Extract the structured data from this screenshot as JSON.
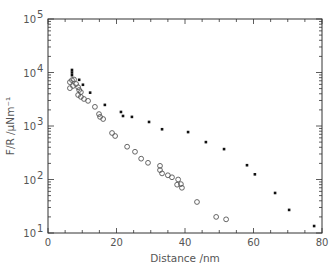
{
  "chart_data": {
    "type": "scatter",
    "title": "",
    "xlabel": "Distance  /nm",
    "ylabel": "F/R  /μNm⁻¹",
    "xlim": [
      0,
      80
    ],
    "ylim": [
      10,
      100000
    ],
    "yscale": "log",
    "xticks": [
      0,
      20,
      40,
      60,
      80
    ],
    "yticks": [
      10,
      100,
      1000,
      10000,
      100000
    ],
    "ytick_labels": [
      {
        "base": "10",
        "exp": "1"
      },
      {
        "base": "10",
        "exp": "2"
      },
      {
        "base": "10",
        "exp": "3"
      },
      {
        "base": "10",
        "exp": "4"
      },
      {
        "base": "10",
        "exp": "5"
      }
    ],
    "grid": false,
    "legend": null,
    "series": [
      {
        "name": "filled",
        "marker": "filled-dot",
        "color": "#111111",
        "points": [
          [
            7.0,
            11150
          ],
          [
            7.0,
            10000
          ],
          [
            7.0,
            8900
          ],
          [
            9.1,
            7300
          ],
          [
            10.2,
            5900
          ],
          [
            12.3,
            4200
          ],
          [
            16.6,
            2480
          ],
          [
            21.3,
            1830
          ],
          [
            21.9,
            1540
          ],
          [
            24.5,
            1480
          ],
          [
            29.5,
            1190
          ],
          [
            33.3,
            870
          ],
          [
            40.9,
            770
          ],
          [
            46.1,
            500
          ],
          [
            51.4,
            370
          ],
          [
            58.1,
            185
          ],
          [
            60.4,
            125
          ],
          [
            66.3,
            56
          ],
          [
            70.4,
            27
          ],
          [
            77.7,
            13.5
          ]
        ]
      },
      {
        "name": "open",
        "marker": "open-circle",
        "color": "#555555",
        "points": [
          [
            6.4,
            6600
          ],
          [
            7.0,
            7200
          ],
          [
            7.6,
            7400
          ],
          [
            6.4,
            5100
          ],
          [
            7.3,
            5600
          ],
          [
            8.2,
            6100
          ],
          [
            8.8,
            5300
          ],
          [
            9.1,
            4700
          ],
          [
            9.6,
            4300
          ],
          [
            8.8,
            3800
          ],
          [
            9.6,
            3500
          ],
          [
            10.5,
            3200
          ],
          [
            11.7,
            2950
          ],
          [
            13.7,
            2280
          ],
          [
            14.9,
            1670
          ],
          [
            15.2,
            1480
          ],
          [
            16.1,
            1350
          ],
          [
            18.7,
            740
          ],
          [
            19.6,
            650
          ],
          [
            23.1,
            410
          ],
          [
            25.4,
            330
          ],
          [
            27.2,
            245
          ],
          [
            29.2,
            205
          ],
          [
            32.7,
            180
          ],
          [
            32.7,
            150
          ],
          [
            33.3,
            130
          ],
          [
            35.0,
            120
          ],
          [
            36.2,
            110
          ],
          [
            38.0,
            100
          ],
          [
            37.7,
            80
          ],
          [
            38.8,
            82
          ],
          [
            39.1,
            70
          ],
          [
            43.5,
            38
          ],
          [
            49.1,
            20
          ],
          [
            52.0,
            18
          ]
        ]
      }
    ]
  }
}
